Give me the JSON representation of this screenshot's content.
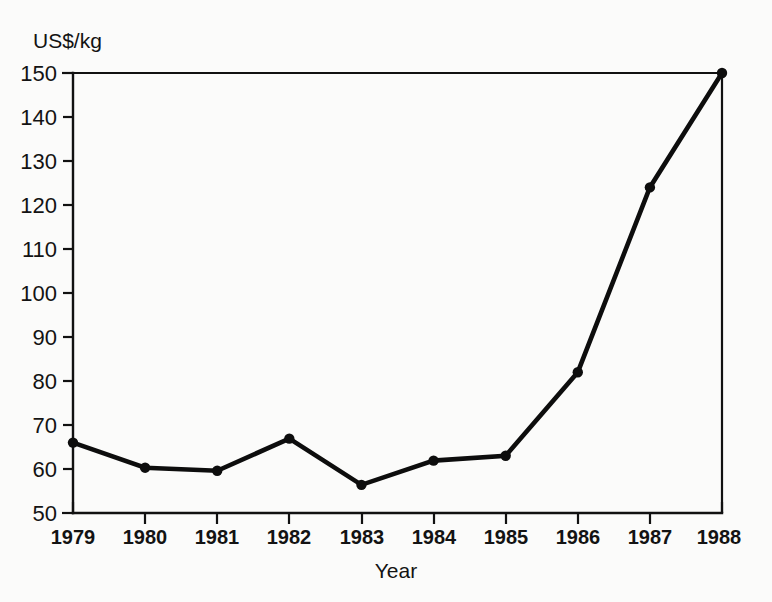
{
  "chart_data": {
    "type": "line",
    "title": "",
    "subtitle": "",
    "xlabel": "Year",
    "ylabel": "US$/kg",
    "x": [
      1979,
      1980,
      1981,
      1982,
      1983,
      1984,
      1985,
      1986,
      1987,
      1988
    ],
    "categories": [
      "1979",
      "1980",
      "1981",
      "1982",
      "1983",
      "1984",
      "1985",
      "1986",
      "1987",
      "1988"
    ],
    "values": [
      66,
      60.3,
      59.6,
      66.9,
      56.4,
      61.9,
      63,
      82,
      124,
      150
    ],
    "series": [
      {
        "name": "Price",
        "values": [
          66,
          60.3,
          59.6,
          66.9,
          56.4,
          61.9,
          63,
          82,
          124,
          150
        ]
      }
    ],
    "xlim": [
      1979,
      1988
    ],
    "ylim": [
      50,
      150
    ],
    "ytick_labels": [
      "150",
      "140",
      "130",
      "120",
      "110",
      "100",
      "90",
      "80",
      "70",
      "60",
      "50"
    ],
    "ytick_values": [
      150,
      140,
      130,
      120,
      110,
      100,
      90,
      80,
      70,
      60,
      50
    ],
    "xtick_labels": [
      "1979",
      "1980",
      "1981",
      "1982",
      "1983",
      "1984",
      "1985",
      "1986",
      "1987",
      "1988"
    ],
    "grid": false,
    "legend": false,
    "legend_position": "none",
    "markers": "filled-circle",
    "line_color": "#0d0d0d",
    "marker_color": "#0d0d0d",
    "axis_color": "#111111",
    "background_color": "#fbfbfa",
    "annotations": []
  },
  "labels": {
    "y_axis_title": "US$/kg",
    "x_axis_title": "Year"
  }
}
